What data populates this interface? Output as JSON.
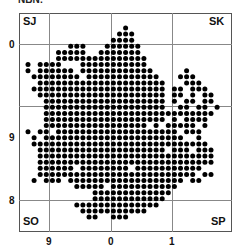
{
  "header": {
    "cut_title": "NBN:"
  },
  "map": {
    "corner_labels": {
      "top_left": "SJ",
      "top_right": "SK",
      "bottom_left": "SO",
      "bottom_right": "SP"
    },
    "x_ticks": [
      "9",
      "0",
      "1"
    ],
    "y_ticks": [
      "0",
      "9",
      "8"
    ],
    "dot_color": "#000000",
    "grid_color": "#888888",
    "grid": {
      "x0": 28,
      "y0": 28,
      "step": 6.1,
      "radius": 2.5
    },
    "rows": [
      "0000000000000000100000000000000000",
      "0000000000000001110000000000000000",
      "0000000000000011110000000000000000",
      "0000000111000111111000000000000000",
      "0000011111001111111000000000000000",
      "0000011111111111111100000000000000",
      "1011110001111111111100000000000000",
      "1011111101111111111110000010000000",
      "0111111110111111111111000111000000",
      "0011111111111111111111100011100000",
      "0111111111111111111111101101110000",
      "0011111111111111111111101101011000",
      "0001111111111111111111101011011000",
      "0001111111111111111111100110110100",
      "0001111111111111111111111111111000",
      "0001111111111111111111101011110000",
      "0001111111111111111101011111010000",
      "1011011111111111111111111011100000",
      "0101111111111111111111111100100000",
      "0111111111111111111111111111110000",
      "0011111111111111111111101110111000",
      "0011111111111111111111111111111000",
      "0011111111111111111111111111111000",
      "0011111101111111101111111111100000",
      "0011111111111111111111111111011000",
      "0101110111111111111111111101100000",
      "0000000011111011111111111000000000",
      "0000000000011111111111110000000000",
      "0000000000011111111111100000000000",
      "0000000011111111111111000000000000",
      "0000000001111111111100000000000000",
      "0000000000110011100000000000000000"
    ]
  }
}
